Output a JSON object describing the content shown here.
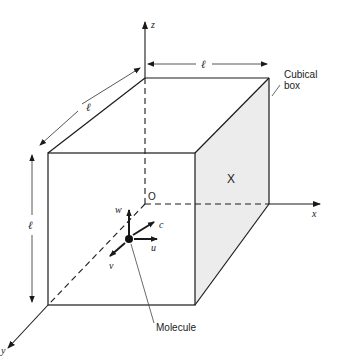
{
  "diagram": {
    "axes": {
      "x_label": "x",
      "y_label": "y",
      "z_label": "z",
      "origin_label": "O"
    },
    "dimensions": {
      "edge_label_top": "ℓ",
      "edge_label_depth": "ℓ",
      "edge_label_height": "ℓ"
    },
    "face_label": "X",
    "box_label_line1": "Cubical",
    "box_label_line2": "box",
    "molecule_label": "Molecule",
    "velocity_components": {
      "u": "u",
      "v": "v",
      "w": "w",
      "c": "c"
    },
    "colors": {
      "stroke": "#1a1a1a",
      "shaded_face": "#ececec",
      "dim_line": "#555555"
    }
  }
}
